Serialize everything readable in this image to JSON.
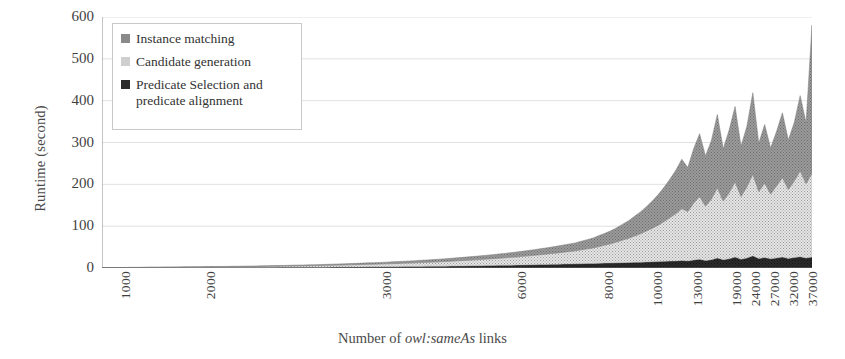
{
  "figure": {
    "y_axis_title": "Runtime (second)",
    "x_axis_title_prefix": "Number of ",
    "x_axis_title_italic": "owl:sameAs",
    "x_axis_title_suffix": " links"
  },
  "legend": {
    "items": [
      {
        "label": "Instance matching",
        "color": "#8a8a8a",
        "swatch_name": "legend-swatch-instance-matching"
      },
      {
        "label": "Candidate generation",
        "color": "#cfcfcf",
        "swatch_name": "legend-swatch-candidate-generation"
      },
      {
        "label": "Predicate Selection and predicate alignment",
        "color": "#2b2b2b",
        "swatch_name": "legend-swatch-predicate-selection"
      }
    ]
  },
  "chart_data": {
    "type": "area",
    "stacked": true,
    "title": "",
    "xlabel": "Number of owl:sameAs links",
    "ylabel": "Runtime (second)",
    "ylim": [
      0,
      600
    ],
    "yticks": [
      0,
      100,
      200,
      300,
      400,
      500,
      600
    ],
    "grid": true,
    "legend_position": "upper-left-inside",
    "xtick_labels": [
      "1000",
      "2000",
      "3000",
      "6000",
      "8000",
      "10000",
      "13000",
      "19000",
      "24000",
      "27000",
      "32000",
      "37000"
    ],
    "xtick_positions_frac": [
      0.007,
      0.127,
      0.374,
      0.565,
      0.688,
      0.757,
      0.813,
      0.867,
      0.895,
      0.921,
      0.948,
      0.975
    ],
    "x_index_count": 121,
    "series": [
      {
        "name": "Predicate Selection and predicate alignment",
        "color": "#2b2b2b",
        "values": [
          0.3,
          0.3,
          0.4,
          0.4,
          0.4,
          0.5,
          0.5,
          0.5,
          0.6,
          0.6,
          0.6,
          0.7,
          0.7,
          0.7,
          0.8,
          0.8,
          0.8,
          0.9,
          0.9,
          1.0,
          1.0,
          1.0,
          1.1,
          1.1,
          1.2,
          1.2,
          1.3,
          1.3,
          1.4,
          1.4,
          1.5,
          1.5,
          1.6,
          1.7,
          1.7,
          1.8,
          1.9,
          1.9,
          2.0,
          2.1,
          2.2,
          2.3,
          2.4,
          2.5,
          2.6,
          2.7,
          2.8,
          2.9,
          3.0,
          3.1,
          3.2,
          3.4,
          3.5,
          3.6,
          3.8,
          3.9,
          4.1,
          4.2,
          4.4,
          4.6,
          4.8,
          5.0,
          5.2,
          5.4,
          5.6,
          5.8,
          6.0,
          6.3,
          6.5,
          6.8,
          7.0,
          7.3,
          7.6,
          7.9,
          8.2,
          8.5,
          8.8,
          9.1,
          9.5,
          9.8,
          10.0,
          10.4,
          10.8,
          11.0,
          11.4,
          11.8,
          12.0,
          12.4,
          12.8,
          13.0,
          13.6,
          14.0,
          14.5,
          15.0,
          15.4,
          16.0,
          16.5,
          17.0,
          18.0,
          17.0,
          19.0,
          21.0,
          18.0,
          20.0,
          24.0,
          20.0,
          22.0,
          26.0,
          21.0,
          24.0,
          29.0,
          23.0,
          25.0,
          22.0,
          24.0,
          26.0,
          23.0,
          25.0,
          27.0,
          24.0,
          26.0
        ]
      },
      {
        "name": "Candidate generation",
        "color": "#cfcfcf",
        "values": [
          0.4,
          0.5,
          0.5,
          0.6,
          0.6,
          0.7,
          0.7,
          0.8,
          0.9,
          0.9,
          1.0,
          1.0,
          1.1,
          1.2,
          1.2,
          1.3,
          1.4,
          1.5,
          1.5,
          1.6,
          1.7,
          1.8,
          1.9,
          2.0,
          2.1,
          2.2,
          2.3,
          2.5,
          2.6,
          2.7,
          2.9,
          3.0,
          3.2,
          3.4,
          3.5,
          3.7,
          3.9,
          4.1,
          4.3,
          4.5,
          4.8,
          5.0,
          5.3,
          5.5,
          5.8,
          6.1,
          6.4,
          6.7,
          7.0,
          7.4,
          7.7,
          8.1,
          8.5,
          8.9,
          9.3,
          9.8,
          10.2,
          10.7,
          11.2,
          11.8,
          12.3,
          12.9,
          13.5,
          14.2,
          14.8,
          15.5,
          16.3,
          17.0,
          17.8,
          18.7,
          19.5,
          20.5,
          21.4,
          22.4,
          23.5,
          24.6,
          25.8,
          27.0,
          28.3,
          29.6,
          31.0,
          33.0,
          35.0,
          37.0,
          40.0,
          43.0,
          46.0,
          50.0,
          54.0,
          58.0,
          63.0,
          68.0,
          74.0,
          80.0,
          87.0,
          95.0,
          104.0,
          113.0,
          124.0,
          118.0,
          136.0,
          150.0,
          130.0,
          145.0,
          168.0,
          140.0,
          158.0,
          180.0,
          150.0,
          170.0,
          195.0,
          160.0,
          178.0,
          155.0,
          172.0,
          190.0,
          165.0,
          183.0,
          205.0,
          178.0,
          200.0
        ]
      },
      {
        "name": "Instance matching",
        "color": "#8a8a8a",
        "values": [
          0.2,
          0.2,
          0.3,
          0.3,
          0.3,
          0.4,
          0.4,
          0.4,
          0.5,
          0.5,
          0.5,
          0.6,
          0.6,
          0.6,
          0.7,
          0.7,
          0.8,
          0.8,
          0.9,
          0.9,
          1.0,
          1.0,
          1.1,
          1.1,
          1.2,
          1.3,
          1.3,
          1.4,
          1.5,
          1.6,
          1.6,
          1.7,
          1.8,
          1.9,
          2.0,
          2.1,
          2.2,
          2.3,
          2.4,
          2.6,
          2.7,
          2.8,
          3.0,
          3.1,
          3.3,
          3.5,
          3.6,
          3.8,
          4.0,
          4.2,
          4.4,
          4.6,
          4.9,
          5.1,
          5.4,
          5.6,
          5.9,
          6.2,
          6.5,
          6.8,
          7.2,
          7.5,
          7.9,
          8.3,
          8.7,
          9.1,
          9.6,
          10.0,
          10.5,
          11.0,
          11.6,
          12.2,
          12.8,
          13.4,
          14.1,
          14.8,
          15.6,
          16.4,
          17.2,
          18.1,
          19.0,
          20.5,
          22.0,
          23.5,
          26.0,
          28.0,
          31.0,
          34.0,
          38.0,
          42.0,
          47.0,
          52.0,
          58.0,
          65.0,
          73.0,
          82.0,
          92.0,
          104.0,
          118.0,
          105.0,
          130.0,
          150.0,
          120.0,
          140.0,
          175.0,
          125.0,
          150.0,
          180.0,
          120.0,
          145.0,
          195.0,
          115.0,
          140.0,
          110.0,
          130.0,
          155.0,
          118.0,
          140.0,
          180.0,
          145.0,
          355.0
        ]
      }
    ],
    "peak_total": 581,
    "peak_label": "37000"
  }
}
